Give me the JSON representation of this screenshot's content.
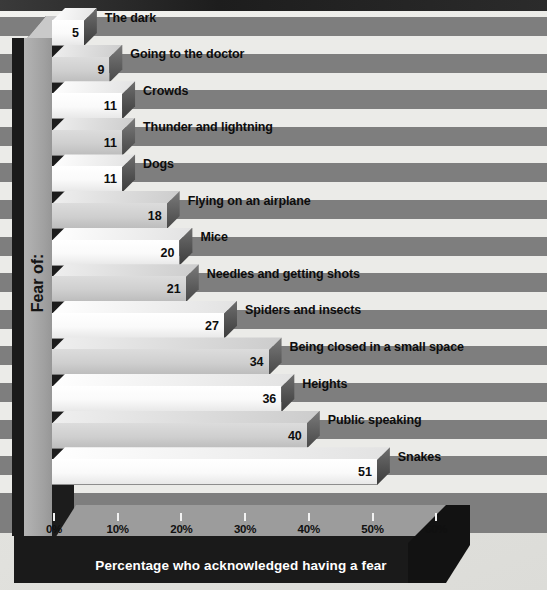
{
  "chart_data": {
    "type": "bar",
    "orientation": "horizontal",
    "title": "",
    "xlabel": "Percentage who acknowledged having a fear",
    "ylabel": "Fear of:",
    "xlim": [
      0,
      65
    ],
    "xticks": [
      "0%",
      "10%",
      "20%",
      "30%",
      "40%",
      "50%",
      "60%"
    ],
    "xtick_values": [
      0,
      10,
      20,
      30,
      40,
      50,
      60
    ],
    "grid": false,
    "legend": "none",
    "categories": [
      "The dark",
      "Going to the doctor",
      "Crowds",
      "Thunder and lightning",
      "Dogs",
      "Flying on an airplane",
      "Mice",
      "Needles and getting shots",
      "Spiders and insects",
      "Being closed in a small space",
      "Heights",
      "Public speaking",
      "Snakes"
    ],
    "values": [
      5,
      9,
      11,
      11,
      11,
      18,
      20,
      21,
      27,
      34,
      36,
      40,
      51
    ],
    "value_labels": [
      "5",
      "9",
      "11",
      "11",
      "11",
      "18",
      "20",
      "21",
      "27",
      "34",
      "36",
      "40",
      "51"
    ]
  },
  "colors": {
    "stripe_dark": "#7e7e7e",
    "stripe_light": "#ebebe8",
    "bar_white": "#ffffff",
    "bar_gray": "#cfcfcf",
    "bar_cap": "#4a4a4a",
    "floor": "#9c9c9c",
    "frame_dark": "#1a1a1a",
    "wall": "#a0a0a0",
    "text": "#0d0d0d",
    "xtitle_text": "#ffffff"
  }
}
